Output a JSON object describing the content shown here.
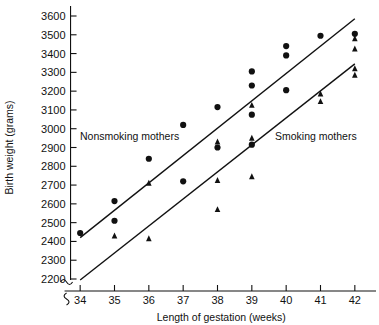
{
  "chart_data": {
    "type": "scatter",
    "title": "",
    "xlabel": "Length of gestation (weeks)",
    "ylabel": "Birth weight (grams)",
    "xlim": [
      33.5,
      42.5
    ],
    "ylim": [
      2200,
      3600
    ],
    "xticks": [
      34,
      35,
      36,
      37,
      38,
      39,
      40,
      41,
      42
    ],
    "yticks": [
      2200,
      2300,
      2400,
      2500,
      2600,
      2700,
      2800,
      2900,
      3000,
      3100,
      3200,
      3300,
      3400,
      3500,
      3600
    ],
    "grid": false,
    "legend_position": "in-plot-annotations",
    "axis_break": "y-axis broken below 2200",
    "series": [
      {
        "name": "Nonsmoking mothers",
        "marker": "circle",
        "color": "#111111",
        "annotation": "Nonsmoking mothers",
        "points": [
          {
            "x": 34,
            "y": 2445
          },
          {
            "x": 35,
            "y": 2615
          },
          {
            "x": 35,
            "y": 2510
          },
          {
            "x": 36,
            "y": 2840
          },
          {
            "x": 37,
            "y": 3020
          },
          {
            "x": 37,
            "y": 2720
          },
          {
            "x": 38,
            "y": 3115
          },
          {
            "x": 38,
            "y": 2900
          },
          {
            "x": 39,
            "y": 3305
          },
          {
            "x": 39,
            "y": 3230
          },
          {
            "x": 39,
            "y": 3075
          },
          {
            "x": 39,
            "y": 2915
          },
          {
            "x": 40,
            "y": 3440
          },
          {
            "x": 40,
            "y": 3390
          },
          {
            "x": 40,
            "y": 3205
          },
          {
            "x": 41,
            "y": 3495
          },
          {
            "x": 42,
            "y": 3505
          }
        ],
        "fit_line": {
          "x1": 34,
          "y1": 2420,
          "x2": 42,
          "y2": 3585
        }
      },
      {
        "name": "Smoking mothers",
        "marker": "triangle",
        "color": "#111111",
        "annotation": "Smoking mothers",
        "points": [
          {
            "x": 35,
            "y": 2430
          },
          {
            "x": 36,
            "y": 2710
          },
          {
            "x": 36,
            "y": 2415
          },
          {
            "x": 38,
            "y": 2930
          },
          {
            "x": 38,
            "y": 2725
          },
          {
            "x": 38,
            "y": 2570
          },
          {
            "x": 39,
            "y": 3125
          },
          {
            "x": 39,
            "y": 2950
          },
          {
            "x": 39,
            "y": 2745
          },
          {
            "x": 41,
            "y": 3185
          },
          {
            "x": 41,
            "y": 3145
          },
          {
            "x": 42,
            "y": 3480
          },
          {
            "x": 42,
            "y": 3425
          },
          {
            "x": 42,
            "y": 3320
          },
          {
            "x": 42,
            "y": 3285
          }
        ],
        "fit_line": {
          "x1": 34,
          "y1": 2195,
          "x2": 42,
          "y2": 3345
        }
      }
    ]
  },
  "axis": {
    "y_title": "Birth weight (grams)",
    "x_title": "Length of gestation (weeks)",
    "y_tick_labels": [
      "3600",
      "3500",
      "3400",
      "3300",
      "3200",
      "3100",
      "3000",
      "2900",
      "2800",
      "2700",
      "2600",
      "2500",
      "2400",
      "2300",
      "2200"
    ],
    "x_tick_labels": [
      "34",
      "35",
      "36",
      "37",
      "38",
      "39",
      "40",
      "41",
      "42"
    ]
  },
  "annotations": {
    "nonsmoking": "Nonsmoking mothers",
    "smoking": "Smoking mothers"
  }
}
